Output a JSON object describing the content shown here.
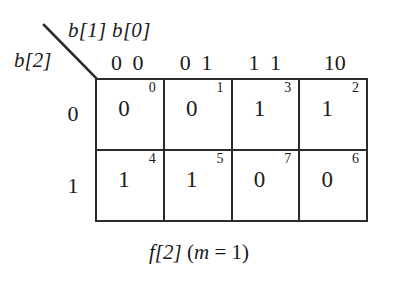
{
  "figure": {
    "type": "karnaugh-map",
    "caption_function": "f[2]",
    "caption_condition": "(m = 1)",
    "caption_full": "f[2] (m = 1)"
  },
  "axes": {
    "column_variable_label": "b[1] b[0]",
    "row_variable_label": "b[2]",
    "column_headers": [
      "0 0",
      "0 1",
      "1 1",
      "10"
    ],
    "row_headers": [
      "0",
      "1"
    ]
  },
  "cells": [
    [
      {
        "index": "0",
        "value": "0"
      },
      {
        "index": "1",
        "value": "0"
      },
      {
        "index": "3",
        "value": "1"
      },
      {
        "index": "2",
        "value": "1"
      }
    ],
    [
      {
        "index": "4",
        "value": "1"
      },
      {
        "index": "5",
        "value": "1"
      },
      {
        "index": "7",
        "value": "0"
      },
      {
        "index": "6",
        "value": "0"
      }
    ]
  ],
  "colors": {
    "ink": "#1a1a1a",
    "rule": "#2b2b2b",
    "background": "#ffffff"
  }
}
